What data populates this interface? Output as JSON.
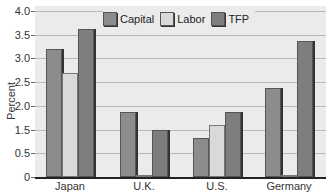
{
  "chart_data": {
    "type": "bar",
    "title": "",
    "xlabel": "",
    "ylabel": "Percent",
    "categories": [
      "Japan",
      "U.K.",
      "U.S.",
      "Germany"
    ],
    "series": [
      {
        "name": "Capital",
        "values": [
          3.2,
          1.87,
          1.33,
          2.38
        ],
        "color": "#8c8c8c"
      },
      {
        "name": "Labor",
        "values": [
          2.7,
          0.12,
          1.6,
          0.4
        ],
        "color": "#d9d9d9"
      },
      {
        "name": "TFP",
        "values": [
          3.63,
          1.5,
          1.87,
          3.37
        ],
        "color": "#7e7e7e"
      }
    ],
    "ytick_labels": [
      "4.0",
      "3.5",
      "3.0",
      "2.5",
      "2.0",
      "1.5",
      "0.5",
      "0"
    ],
    "ylim": [
      0,
      4.0
    ],
    "grid": true,
    "legend_position": "top-center"
  },
  "legend": {
    "items": [
      {
        "label": "Capital"
      },
      {
        "label": "Labor"
      },
      {
        "label": "TFP"
      }
    ]
  }
}
